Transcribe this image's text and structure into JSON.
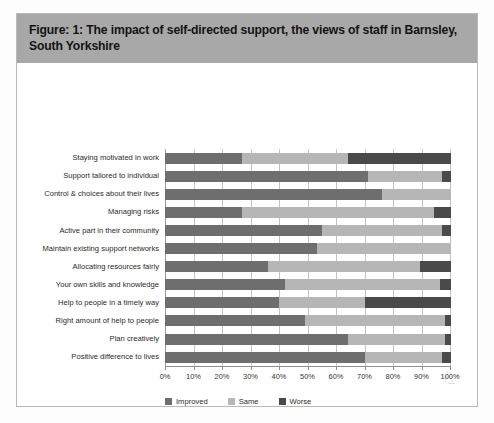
{
  "figure": {
    "title": "Figure: 1: The impact of self-directed support, the views of staff in Barnsley, South Yorkshire"
  },
  "colors": {
    "title_banner": "#a8a8a8",
    "improved": "#6e6e6e",
    "same": "#b6b6b6",
    "worse": "#4a4a4a",
    "gridline": "#c3c3c3",
    "frame": "#b9b9b9"
  },
  "legend": {
    "position": "bottom-left",
    "items": [
      {
        "label": "Improved",
        "color": "#6e6e6e"
      },
      {
        "label": "Same",
        "color": "#b6b6b6"
      },
      {
        "label": "Worse",
        "color": "#4a4a4a"
      }
    ]
  },
  "chart_data": {
    "type": "bar",
    "orientation": "horizontal",
    "stacked": true,
    "title": "Figure: 1: The impact of self-directed support, the views of staff in Barnsley, South Yorkshire",
    "xlabel": "",
    "ylabel": "",
    "xlim": [
      0,
      100
    ],
    "xunit": "%",
    "grid": true,
    "xticks": [
      0,
      10,
      20,
      30,
      40,
      50,
      60,
      70,
      80,
      90,
      100
    ],
    "xticklabels": [
      "0%",
      "10%",
      "20%",
      "30%",
      "40%",
      "50%",
      "60%",
      "70%",
      "80%",
      "90%",
      "100%"
    ],
    "categories": [
      "Staying motivated in work",
      "Support tailored to individual",
      "Control & choices about their lives",
      "Managing risks",
      "Active part in their community",
      "Maintain existing support networks",
      "Allocating resources fairly",
      "Your own skills and knowledge",
      "Help to people in a timely way",
      "Right amount of help to people",
      "Plan creatively",
      "Positive difference to lives"
    ],
    "series": [
      {
        "name": "Improved",
        "color": "#6e6e6e",
        "values": [
          27,
          71,
          76,
          27,
          55,
          53,
          36,
          42,
          40,
          49,
          64,
          70
        ]
      },
      {
        "name": "Same",
        "color": "#b6b6b6",
        "values": [
          37,
          26,
          24,
          67,
          42,
          47,
          53,
          54,
          30,
          49,
          34,
          27
        ]
      },
      {
        "name": "Worse",
        "color": "#4a4a4a",
        "values": [
          36,
          3,
          0,
          6,
          3,
          0,
          11,
          4,
          30,
          2,
          2,
          3
        ]
      }
    ],
    "rows": [
      {
        "category": "Staying motivated in work",
        "Improved": 27,
        "Same": 37,
        "Worse": 36
      },
      {
        "category": "Support tailored to individual",
        "Improved": 71,
        "Same": 26,
        "Worse": 3
      },
      {
        "category": "Control & choices about their lives",
        "Improved": 76,
        "Same": 24,
        "Worse": 0
      },
      {
        "category": "Managing risks",
        "Improved": 27,
        "Same": 67,
        "Worse": 6
      },
      {
        "category": "Active part in their community",
        "Improved": 55,
        "Same": 42,
        "Worse": 3
      },
      {
        "category": "Maintain existing support networks",
        "Improved": 53,
        "Same": 47,
        "Worse": 0
      },
      {
        "category": "Allocating resources fairly",
        "Improved": 36,
        "Same": 53,
        "Worse": 11
      },
      {
        "category": "Your own skills and knowledge",
        "Improved": 42,
        "Same": 54,
        "Worse": 4
      },
      {
        "category": "Help to people in a timely way",
        "Improved": 40,
        "Same": 30,
        "Worse": 30
      },
      {
        "category": "Right amount of help to people",
        "Improved": 49,
        "Same": 49,
        "Worse": 2
      },
      {
        "category": "Plan creatively",
        "Improved": 64,
        "Same": 34,
        "Worse": 2
      },
      {
        "category": "Positive difference to lives",
        "Improved": 70,
        "Same": 27,
        "Worse": 3
      }
    ]
  }
}
